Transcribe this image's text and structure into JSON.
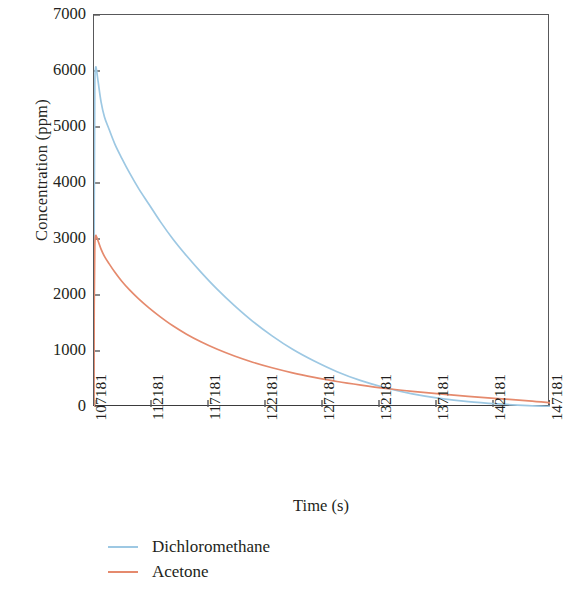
{
  "chart_data": {
    "type": "line",
    "title": "",
    "xlabel": "Time (s)",
    "ylabel": "Concentration (ppm)",
    "xlim": [
      107181,
      147181
    ],
    "ylim": [
      0,
      7000
    ],
    "grid": false,
    "legend_position": "below",
    "xticks": [
      "107181",
      "112181",
      "117181",
      "122181",
      "127181",
      "132181",
      "137181",
      "142181",
      "147181"
    ],
    "xtick_values": [
      107181,
      112181,
      117181,
      122181,
      127181,
      132181,
      137181,
      142181,
      147181
    ],
    "yticks": [
      "0",
      "1000",
      "2000",
      "3000",
      "4000",
      "5000",
      "6000",
      "7000"
    ],
    "ytick_values": [
      0,
      1000,
      2000,
      3000,
      4000,
      5000,
      6000,
      7000
    ],
    "series": [
      {
        "name": "Dichloromethane",
        "color": "#9dc8e3",
        "x": [
          107181,
          107200,
          107250,
          107320,
          107400,
          107550,
          107800,
          108100,
          108500,
          109000,
          109600,
          110300,
          111100,
          112000,
          113000,
          114100,
          115300,
          116600,
          118000,
          119500,
          121100,
          122800,
          124600,
          126500,
          128500,
          130600,
          132800,
          135100,
          137500,
          140000,
          142600,
          145300,
          147181
        ],
        "values": [
          0,
          3500,
          5700,
          6050,
          6020,
          5800,
          5450,
          5180,
          4960,
          4700,
          4450,
          4180,
          3900,
          3620,
          3310,
          3000,
          2700,
          2400,
          2100,
          1810,
          1530,
          1270,
          1030,
          820,
          630,
          470,
          340,
          235,
          155,
          95,
          55,
          25,
          10
        ]
      },
      {
        "name": "Acetone",
        "color": "#e58a6d",
        "x": [
          107181,
          107200,
          107250,
          107320,
          107400,
          107550,
          107800,
          108100,
          108500,
          109000,
          109600,
          110300,
          111100,
          112000,
          113000,
          114100,
          115300,
          116600,
          118000,
          119500,
          121100,
          122800,
          124600,
          126500,
          128500,
          130600,
          132800,
          135100,
          137500,
          140000,
          142600,
          145300,
          147181
        ],
        "values": [
          0,
          1800,
          2850,
          3050,
          3040,
          2960,
          2820,
          2690,
          2560,
          2410,
          2250,
          2090,
          1930,
          1770,
          1610,
          1450,
          1300,
          1160,
          1030,
          910,
          800,
          700,
          610,
          530,
          455,
          390,
          330,
          280,
          235,
          190,
          150,
          110,
          75
        ]
      }
    ]
  },
  "legend": {
    "items": [
      {
        "label": "Dichloromethane",
        "color": "#9dc8e3"
      },
      {
        "label": "Acetone",
        "color": "#e58a6d"
      }
    ]
  },
  "axes": {
    "frame_color": "#58585a"
  }
}
